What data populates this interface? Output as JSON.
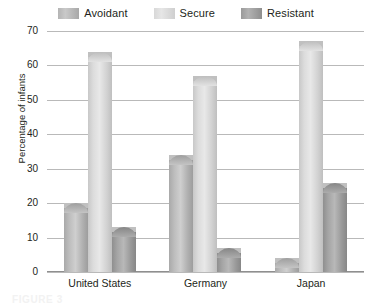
{
  "chart_data": {
    "type": "bar",
    "title": "",
    "xlabel": "",
    "ylabel": "Percentage of infants",
    "categories": [
      "United States",
      "Germany",
      "Japan"
    ],
    "series": [
      {
        "name": "Avoidant",
        "values": [
          20,
          34,
          4
        ],
        "color": "#b4b4b4"
      },
      {
        "name": "Secure",
        "values": [
          64,
          57,
          67
        ],
        "color": "#dcdcdc"
      },
      {
        "name": "Resistant",
        "values": [
          13,
          7,
          26
        ],
        "color": "#9a9a9a"
      }
    ],
    "ylim": [
      0,
      70
    ],
    "yticks": [
      70,
      60,
      50,
      40,
      30,
      20,
      10,
      0
    ],
    "grid": true,
    "legend_position": "top"
  },
  "legend": {
    "items": [
      {
        "label": "Avoidant"
      },
      {
        "label": "Secure"
      },
      {
        "label": "Resistant"
      }
    ]
  },
  "caption": {
    "text": "FIGURE 3"
  }
}
